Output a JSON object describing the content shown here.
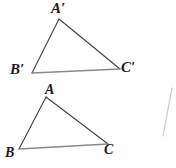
{
  "figure": {
    "background_color": "#ffffff",
    "width": 176,
    "height": 168,
    "stroke_colors": {
      "triangle_side_dark": "#3f3f3f",
      "triangle_base_gray": "#8a8a8a",
      "stray_line_light": "#c9c9c9"
    },
    "label_color": "#1b1b1b"
  },
  "shapes": {
    "triangle_image": {
      "name": "triangle-a-prime-b-prime-c-prime",
      "vertices": [
        {
          "label": "A'",
          "x": 59,
          "y": 19
        },
        {
          "label": "B'",
          "x": 32,
          "y": 73
        },
        {
          "label": "C'",
          "x": 120,
          "y": 69
        }
      ],
      "edges": [
        {
          "from": "A'",
          "to": "B'",
          "color": "#3f3f3f",
          "width": 1.1
        },
        {
          "from": "A'",
          "to": "C'",
          "color": "#3f3f3f",
          "width": 1.1
        },
        {
          "from": "B'",
          "to": "C'",
          "color": "#8a8a8a",
          "width": 1.3
        }
      ]
    },
    "triangle_preimage": {
      "name": "triangle-a-b-c",
      "vertices": [
        {
          "label": "A",
          "x": 46,
          "y": 97
        },
        {
          "label": "B",
          "x": 19,
          "y": 149
        },
        {
          "label": "C",
          "x": 108,
          "y": 144
        }
      ],
      "edges": [
        {
          "from": "A",
          "to": "B",
          "color": "#3f3f3f",
          "width": 1.1
        },
        {
          "from": "A",
          "to": "C",
          "color": "#3f3f3f",
          "width": 1.1
        },
        {
          "from": "B",
          "to": "C",
          "color": "#8a8a8a",
          "width": 1.3
        }
      ]
    },
    "stray_line": {
      "name": "stray-diagonal-line",
      "x1": 172,
      "y1": 88,
      "x2": 163,
      "y2": 136,
      "color": "#c9c9c9",
      "width": 1.2
    }
  },
  "labels": {
    "a_prime": "A′",
    "b_prime": "B′",
    "c_prime": "C′",
    "a": "A",
    "b": "B",
    "c": "C"
  }
}
